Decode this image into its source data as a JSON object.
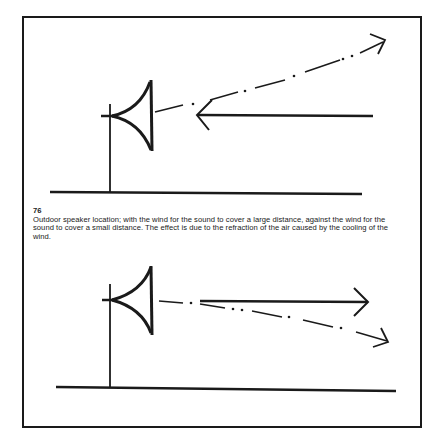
{
  "figure": {
    "number": "76",
    "caption": "Outdoor speaker location; with the wind for the sound to cover a large distance, against the wind for the sound to cover a small distance. The effect is due to the refraction of the air caused by the cooling of the wind.",
    "colors": {
      "ink": "#1a1a1a",
      "paper": "#ffffff"
    }
  },
  "diagrams": [
    {
      "id": "against-wind",
      "elements": [
        "speaker-on-pole",
        "ground-line",
        "wind-arrow-leftward",
        "sound-path-dash-dot-curving-up"
      ],
      "wind_direction": "toward speaker",
      "sound_path": "bends upward"
    },
    {
      "id": "with-wind",
      "elements": [
        "speaker-on-pole",
        "ground-line",
        "wind-arrow-rightward",
        "sound-path-dash-dot-curving-down"
      ],
      "wind_direction": "away from speaker",
      "sound_path": "bends downward"
    }
  ]
}
